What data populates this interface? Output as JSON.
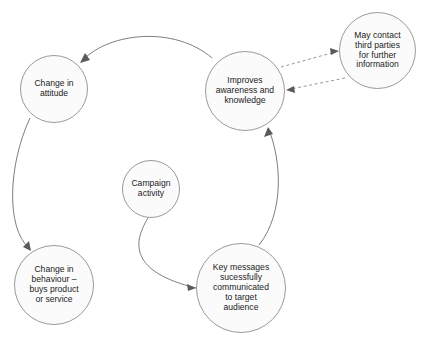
{
  "diagram": {
    "background_color": "#ffffff",
    "node_fill_color": "#fbfbfb",
    "node_border_color": "#9a9a9a",
    "edge_color": "#6e6e6e",
    "dashed_edge_color": "#8d8d8d",
    "nodes": [
      {
        "id": "change-attitude",
        "label": "Change in\nattitude",
        "shape": "circle"
      },
      {
        "id": "improves-awareness",
        "label": "Improves\nawareness and\nknowledge",
        "shape": "circle"
      },
      {
        "id": "third-parties",
        "label": "May contact\nthird parties\nfor further\ninformation",
        "shape": "circle"
      },
      {
        "id": "campaign-activity",
        "label": "Campaign\nactivity",
        "shape": "circle"
      },
      {
        "id": "change-behaviour",
        "label": "Change in\nbehaviour –\nbuys product\nor service",
        "shape": "circle"
      },
      {
        "id": "key-messages",
        "label": "Key messages\nsucessfully\ncommunicated\nto target\naudience",
        "shape": "circle"
      }
    ],
    "edges": [
      {
        "id": "campaign-to-key-messages",
        "from": "campaign-activity",
        "to": "key-messages",
        "style": "solid",
        "arrow": "single"
      },
      {
        "id": "key-messages-to-improves",
        "from": "key-messages",
        "to": "improves-awareness",
        "style": "solid",
        "arrow": "single"
      },
      {
        "id": "improves-to-change-attitude",
        "from": "improves-awareness",
        "to": "change-attitude",
        "style": "solid",
        "arrow": "single"
      },
      {
        "id": "change-attitude-to-change-behaviour",
        "from": "change-attitude",
        "to": "change-behaviour",
        "style": "solid",
        "arrow": "single"
      },
      {
        "id": "improves-to-third-parties",
        "from": "improves-awareness",
        "to": "third-parties",
        "style": "dashed",
        "arrow": "single"
      },
      {
        "id": "third-parties-to-improves",
        "from": "third-parties",
        "to": "improves-awareness",
        "style": "dashed",
        "arrow": "single"
      }
    ]
  }
}
